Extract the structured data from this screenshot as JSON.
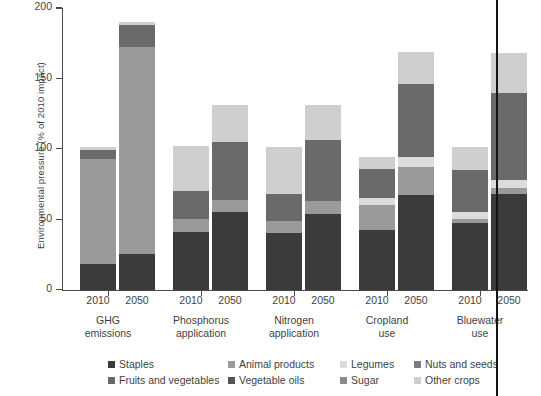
{
  "axes": {
    "ylabel": "Environmental pressure (% of 2010 impact)",
    "yticks": [
      "0",
      "50",
      "100",
      "150",
      "200"
    ],
    "ylim": [
      0,
      200
    ]
  },
  "groups": [
    {
      "name": "GHG\nemissions",
      "line1": "GHG",
      "line2": "emissions",
      "years": [
        "2010",
        "2050"
      ]
    },
    {
      "name": "Phosphorus application",
      "line1": "Phosphorus",
      "line2": "application",
      "years": [
        "2010",
        "2050"
      ]
    },
    {
      "name": "Nitrogen application",
      "line1": "Nitrogen",
      "line2": "application",
      "years": [
        "2010",
        "2050"
      ]
    },
    {
      "name": "Cropland use",
      "line1": "Cropland",
      "line2": "use",
      "years": [
        "2010",
        "2050"
      ]
    },
    {
      "name": "Bluewater use",
      "line1": "Bluewater",
      "line2": "use",
      "years": [
        "2010",
        "2050"
      ]
    }
  ],
  "legend": [
    {
      "label": "Staples",
      "color": "#3b3b3b"
    },
    {
      "label": "Animal products",
      "color": "#9a9a9a"
    },
    {
      "label": "Legumes",
      "color": "#dcdcdc"
    },
    {
      "label": "Nuts and seeds",
      "color": "#7d7d7d"
    },
    {
      "label": "Fruits and vegetables",
      "color": "#6a6a6a"
    },
    {
      "label": "Vegetable oils",
      "color": "#555555"
    },
    {
      "label": "Sugar",
      "color": "#8a8a8a"
    },
    {
      "label": "Other crops",
      "color": "#cfcfcf"
    }
  ],
  "chart_data": {
    "type": "bar",
    "title": "",
    "xlabel": "",
    "ylabel": "Environmental pressure (% of 2010 impact)",
    "ylim": [
      0,
      200
    ],
    "grid": false,
    "stacked": true,
    "legend_position": "bottom",
    "categories": [
      "GHG emissions 2010",
      "GHG emissions 2050",
      "Phosphorus application 2010",
      "Phosphorus application 2050",
      "Nitrogen application 2010",
      "Nitrogen application 2050",
      "Cropland use 2010",
      "Cropland use 2050",
      "Bluewater use 2010",
      "Bluewater use 2050"
    ],
    "series": [
      {
        "name": "Staples",
        "color": "#3b3b3b",
        "values": [
          18,
          25,
          41,
          55,
          40,
          54,
          42,
          67,
          47,
          68
        ]
      },
      {
        "name": "Animal products",
        "color": "#9a9a9a",
        "values": [
          75,
          147,
          9,
          9,
          9,
          9,
          18,
          20,
          3,
          4
        ]
      },
      {
        "name": "Legumes",
        "color": "#dcdcdc",
        "values": [
          0,
          0,
          0,
          0,
          0,
          0,
          5,
          7,
          5,
          6
        ]
      },
      {
        "name": "Nuts and seeds",
        "color": "#7d7d7d",
        "values": [
          0,
          0,
          0,
          0,
          0,
          0,
          0,
          0,
          0,
          0
        ]
      },
      {
        "name": "Fruits and vegetables",
        "color": "#6a6a6a",
        "values": [
          6,
          16,
          20,
          41,
          19,
          43,
          21,
          52,
          30,
          62
        ]
      },
      {
        "name": "Vegetable oils",
        "color": "#555555",
        "values": [
          0,
          0,
          0,
          0,
          0,
          0,
          0,
          0,
          0,
          0
        ]
      },
      {
        "name": "Sugar",
        "color": "#8a8a8a",
        "values": [
          0,
          0,
          0,
          0,
          0,
          0,
          0,
          0,
          0,
          0
        ]
      },
      {
        "name": "Other crops",
        "color": "#cfcfcf",
        "values": [
          2,
          2,
          32,
          26,
          33,
          25,
          8,
          23,
          16,
          28
        ]
      }
    ],
    "totals": [
      101,
      190,
      102,
      131,
      101,
      131,
      94,
      169,
      101,
      168
    ]
  }
}
